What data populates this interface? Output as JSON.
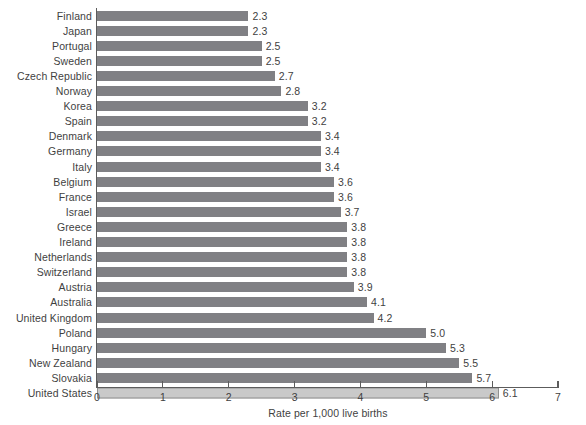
{
  "chart_data": {
    "type": "bar",
    "orientation": "horizontal",
    "title": "",
    "xlabel": "Rate per 1,000 live births",
    "ylabel": "",
    "xlim": [
      0,
      7
    ],
    "xticks": [
      "0",
      "1",
      "2",
      "3",
      "4",
      "5",
      "6",
      "7"
    ],
    "grid": false,
    "legend": null,
    "categories": [
      "Finland",
      "Japan",
      "Portugal",
      "Sweden",
      "Czech Republic",
      "Norway",
      "Korea",
      "Spain",
      "Denmark",
      "Germany",
      "Italy",
      "Belgium",
      "France",
      "Israel",
      "Greece",
      "Ireland",
      "Netherlands",
      "Switzerland",
      "Austria",
      "Australia",
      "United Kingdom",
      "Poland",
      "Hungary",
      "New Zealand",
      "Slovakia",
      "United States"
    ],
    "values": [
      2.3,
      2.3,
      2.5,
      2.5,
      2.7,
      2.8,
      3.2,
      3.2,
      3.4,
      3.4,
      3.4,
      3.6,
      3.6,
      3.7,
      3.8,
      3.8,
      3.8,
      3.8,
      3.9,
      4.1,
      4.2,
      5.0,
      5.3,
      5.5,
      5.7,
      6.1
    ],
    "value_labels": [
      "2.3",
      "2.3",
      "2.5",
      "2.5",
      "2.7",
      "2.8",
      "3.2",
      "3.2",
      "3.4",
      "3.4",
      "3.4",
      "3.6",
      "3.6",
      "3.7",
      "3.8",
      "3.8",
      "3.8",
      "3.8",
      "3.9",
      "4.1",
      "4.2",
      "5.0",
      "5.3",
      "5.5",
      "5.7",
      "6.1"
    ],
    "highlight_index": 25,
    "colors": {
      "bar": "#808084",
      "bar_highlight": "#c9c9c9",
      "bar_highlight_border": "#8f8f8f",
      "axis": "#5c5c5c",
      "text": "#3f3f3f",
      "background": "#ffffff"
    }
  }
}
